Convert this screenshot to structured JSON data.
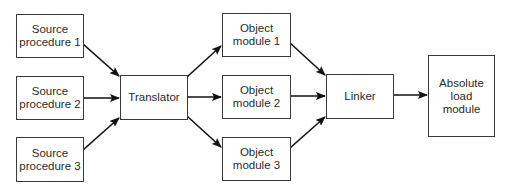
{
  "diagram": {
    "nodes": {
      "source1": {
        "label": "Source\nprocedure 1"
      },
      "source2": {
        "label": "Source\nprocedure 2"
      },
      "source3": {
        "label": "Source\nprocedure 3"
      },
      "translator": {
        "label": "Translator"
      },
      "object1": {
        "label": "Object\nmodule 1"
      },
      "object2": {
        "label": "Object\nmodule 2"
      },
      "object3": {
        "label": "Object\nmodule 3"
      },
      "linker": {
        "label": "Linker"
      },
      "absolute": {
        "label": "Absolute\nload\nmodule"
      }
    },
    "edges": [
      {
        "from": "source1",
        "to": "translator"
      },
      {
        "from": "source2",
        "to": "translator"
      },
      {
        "from": "source3",
        "to": "translator"
      },
      {
        "from": "translator",
        "to": "object1"
      },
      {
        "from": "translator",
        "to": "object2"
      },
      {
        "from": "translator",
        "to": "object3"
      },
      {
        "from": "object1",
        "to": "linker"
      },
      {
        "from": "object2",
        "to": "linker"
      },
      {
        "from": "object3",
        "to": "linker"
      },
      {
        "from": "linker",
        "to": "absolute"
      }
    ],
    "colors": {
      "stroke": "#3a3a3a",
      "arrow": "#111111",
      "text": "#2a2a2a",
      "background": "#ffffff"
    }
  }
}
